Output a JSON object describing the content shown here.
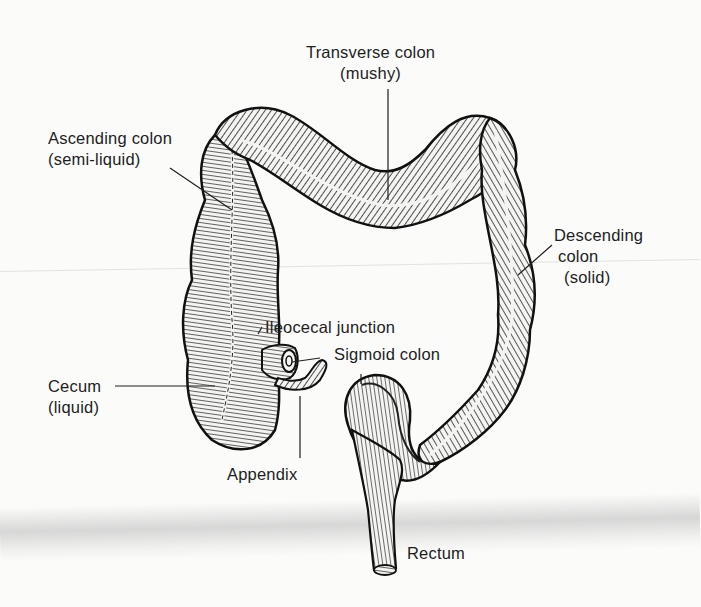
{
  "figure": {
    "background_color": "#fbfbfa",
    "ink_color": "#1e1e1e"
  },
  "labels": {
    "transverse": {
      "name": "Transverse colon",
      "state": "(mushy)"
    },
    "ascending": {
      "name": "Ascending colon",
      "state": "(semi-liquid)"
    },
    "descending": {
      "name": "Descending",
      "name2": "colon",
      "state": "(solid)"
    },
    "ileocecal": {
      "name": "Ileocecal junction"
    },
    "sigmoid": {
      "name": "Sigmoid colon"
    },
    "cecum": {
      "name": "Cecum",
      "state": "(liquid)"
    },
    "appendix": {
      "name": "Appendix"
    },
    "rectum": {
      "name": "Rectum"
    }
  }
}
